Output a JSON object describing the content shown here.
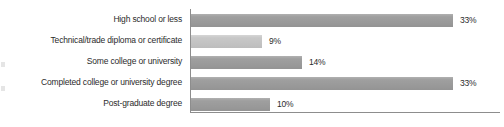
{
  "chart_data": {
    "type": "bar",
    "orientation": "horizontal",
    "title": "",
    "xlabel": "",
    "ylabel": "",
    "categories": [
      "High school or less",
      "Technical/trade diploma or certificate",
      "Some college or university",
      "Completed college or university degree",
      "Post-graduate degree"
    ],
    "values": [
      33,
      9,
      14,
      33,
      10
    ],
    "value_labels": [
      "33%",
      "9%",
      "14%",
      "33%",
      "10%"
    ],
    "xlim": [
      0,
      38
    ],
    "grid": false,
    "legend": null,
    "bar_colors": [
      "#9b9b9b",
      "#c4c4c4",
      "#9b9b9b",
      "#9b9b9b",
      "#9b9b9b"
    ],
    "axis_color": "#8d8d8d",
    "text_color": "#2b2b2b",
    "background": "#ffffff"
  },
  "bars": [
    {
      "label": "High school or less",
      "value_label": "33%",
      "width_px": 262,
      "light": false,
      "top": 5
    },
    {
      "label": "Technical/trade diploma or certificate",
      "value_label": "9%",
      "width_px": 71,
      "light": true,
      "top": 26
    },
    {
      "label": "Some college or university",
      "value_label": "14%",
      "width_px": 111,
      "light": false,
      "top": 47
    },
    {
      "label": "Completed college or university degree",
      "value_label": "33%",
      "width_px": 262,
      "light": false,
      "top": 68
    },
    {
      "label": "Post-graduate degree",
      "value_label": "10%",
      "width_px": 79,
      "light": false,
      "top": 89
    }
  ]
}
